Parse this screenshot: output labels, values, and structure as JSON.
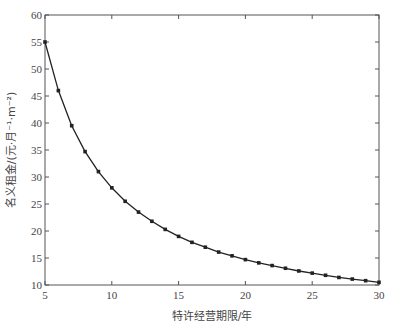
{
  "chart_data": {
    "type": "line",
    "title": "",
    "xlabel": "特许经营期限/年",
    "ylabel": "名义租金/(元·月⁻¹·m⁻²)",
    "xlim": [
      5,
      30
    ],
    "ylim": [
      10,
      60
    ],
    "xticks": [
      5,
      10,
      15,
      20,
      25,
      30
    ],
    "yticks": [
      10,
      15,
      20,
      25,
      30,
      35,
      40,
      45,
      50,
      55,
      60
    ],
    "grid": false,
    "legend": null,
    "series": [
      {
        "name": "名义租金",
        "marker": "dot",
        "color": "#222222",
        "x": [
          5,
          6,
          7,
          8,
          9,
          10,
          11,
          12,
          13,
          14,
          15,
          16,
          17,
          18,
          19,
          20,
          21,
          22,
          23,
          24,
          25,
          26,
          27,
          28,
          29,
          30
        ],
        "values": [
          55.0,
          46.0,
          39.5,
          34.7,
          31.0,
          28.0,
          25.5,
          23.5,
          21.8,
          20.3,
          19.0,
          17.9,
          17.0,
          16.1,
          15.4,
          14.7,
          14.1,
          13.6,
          13.1,
          12.6,
          12.2,
          11.8,
          11.4,
          11.1,
          10.8,
          10.5
        ]
      }
    ]
  },
  "axes": {
    "x_title": "特许经营期限/年",
    "y_title": "名义租金/(元·月⁻¹·m⁻²)"
  }
}
